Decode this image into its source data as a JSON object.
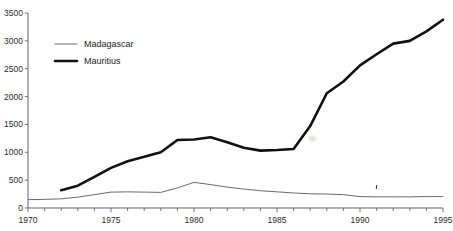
{
  "page": {
    "title_fragment": "",
    "background_color": "#ffffff"
  },
  "chart_data": {
    "type": "line",
    "title": "",
    "subtitle": "",
    "xlabel": "",
    "ylabel": "",
    "xlim": [
      1970,
      1995
    ],
    "ylim": [
      0,
      3500
    ],
    "grid": false,
    "legend_position": "top-left",
    "y_ticks": [
      0,
      500,
      1000,
      1500,
      2000,
      2500,
      3000,
      3500
    ],
    "y_tick_labels": [
      "0",
      "500",
      "1000",
      "1500",
      "2000",
      "2500",
      "3000",
      "3500"
    ],
    "x_ticks": [
      1970,
      1971,
      1972,
      1973,
      1974,
      1975,
      1976,
      1977,
      1978,
      1979,
      1980,
      1981,
      1982,
      1983,
      1984,
      1985,
      1986,
      1987,
      1988,
      1989,
      1990,
      1991,
      1992,
      1993,
      1994,
      1995
    ],
    "x_tick_labels_major": [
      "1970",
      "1975",
      "1980",
      "1985",
      "1990",
      "1995"
    ],
    "x_major_ticks": [
      1970,
      1975,
      1980,
      1985,
      1990,
      1995
    ],
    "series": [
      {
        "name": "Madagascar",
        "style": "thin",
        "color": "#6b6b6b",
        "line_width": 1,
        "x": [
          1970,
          1971,
          1972,
          1973,
          1974,
          1975,
          1976,
          1977,
          1978,
          1979,
          1980,
          1981,
          1982,
          1983,
          1984,
          1985,
          1986,
          1987,
          1988,
          1989,
          1990,
          1991,
          1992,
          1993,
          1994,
          1995
        ],
        "values": [
          150,
          155,
          165,
          195,
          240,
          285,
          290,
          285,
          280,
          360,
          460,
          420,
          375,
          340,
          310,
          290,
          270,
          255,
          250,
          240,
          205,
          200,
          200,
          200,
          205,
          205
        ]
      },
      {
        "name": "Mauritius",
        "style": "thick",
        "color": "#111111",
        "line_width": 2.6,
        "x": [
          1972,
          1973,
          1974,
          1975,
          1976,
          1977,
          1978,
          1979,
          1980,
          1981,
          1982,
          1983,
          1984,
          1985,
          1986,
          1987,
          1988,
          1989,
          1990,
          1991,
          1992,
          1993,
          1994,
          1995
        ],
        "values": [
          320,
          400,
          560,
          720,
          840,
          920,
          1000,
          1220,
          1230,
          1270,
          1180,
          1080,
          1030,
          1040,
          1060,
          1470,
          2060,
          2270,
          2560,
          2760,
          2950,
          3000,
          3170,
          3380
        ]
      }
    ]
  },
  "legend": {
    "entries": [
      {
        "label": "Madagascar",
        "style": "thin"
      },
      {
        "label": "Mauritius",
        "style": "thick"
      }
    ]
  }
}
